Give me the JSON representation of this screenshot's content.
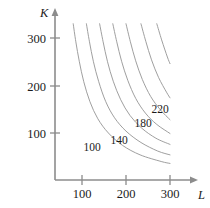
{
  "chart_data": {
    "type": "line",
    "title": "",
    "subtitle": "",
    "xlabel": "L",
    "ylabel": "K",
    "xlim": [
      0,
      330
    ],
    "ylim": [
      0,
      345
    ],
    "grid": false,
    "legend": "none",
    "xticks": [
      100,
      200,
      300
    ],
    "xticklabels": [
      "100",
      "200",
      "300"
    ],
    "yticks": [
      100,
      200,
      300
    ],
    "yticklabels": [
      "100",
      "200",
      "300"
    ],
    "axis_arrows": true,
    "series": [
      {
        "name": "100",
        "level": 100,
        "labeled": true,
        "label_x": 118,
        "label_y": 62,
        "x": [
          80,
          86,
          94,
          104,
          118,
          136,
          160,
          192,
          232,
          280,
          300
        ],
        "y": [
          330,
          292,
          250,
          208,
          166,
          130,
          100,
          74,
          54,
          40,
          36
        ]
      },
      {
        "name": "120",
        "level": 120,
        "labeled": false,
        "x": [
          110,
          117,
          126,
          138,
          154,
          174,
          200,
          234,
          272,
          300
        ],
        "y": [
          330,
          292,
          250,
          208,
          166,
          132,
          104,
          80,
          62,
          54
        ]
      },
      {
        "name": "140",
        "level": 140,
        "labeled": true,
        "label_x": 160,
        "label_y": 76,
        "x": [
          140,
          148,
          158,
          171,
          188,
          209,
          236,
          268,
          300
        ],
        "y": [
          330,
          292,
          250,
          209,
          170,
          137,
          110,
          89,
          76
        ]
      },
      {
        "name": "160",
        "level": 160,
        "labeled": false,
        "x": [
          170,
          179,
          190,
          204,
          222,
          244,
          270,
          300
        ],
        "y": [
          330,
          292,
          251,
          211,
          173,
          142,
          118,
          99
        ]
      },
      {
        "name": "180",
        "level": 180,
        "labeled": true,
        "label_x": 216,
        "label_y": 122,
        "x": [
          200,
          210,
          222,
          237,
          256,
          278,
          300
        ],
        "y": [
          330,
          292,
          252,
          213,
          177,
          149,
          128
        ]
      },
      {
        "name": "200",
        "level": 200,
        "labeled": false,
        "x": [
          234,
          245,
          258,
          274,
          292,
          300
        ],
        "y": [
          330,
          293,
          254,
          217,
          186,
          174
        ]
      },
      {
        "name": "220",
        "level": 220,
        "labeled": true,
        "label_x": 268,
        "label_y": 165,
        "x": [
          270,
          281,
          294,
          300
        ],
        "y": [
          330,
          296,
          260,
          246
        ]
      }
    ],
    "contour_labels": [
      {
        "text": "100",
        "x": 92,
        "y": 151
      },
      {
        "text": "140",
        "x": 119,
        "y": 144
      },
      {
        "text": "180",
        "x": 143,
        "y": 127
      },
      {
        "text": "220",
        "x": 160,
        "y": 113
      }
    ]
  },
  "axes": {
    "y_axis_label": "K",
    "x_axis_label": "L",
    "y_ticks": [
      {
        "label": "300",
        "y": 38
      },
      {
        "label": "200",
        "y": 86
      },
      {
        "label": "100",
        "y": 133
      }
    ],
    "x_ticks": [
      {
        "label": "100",
        "x": 82
      },
      {
        "label": "200",
        "x": 126
      },
      {
        "label": "300",
        "x": 170
      }
    ]
  },
  "colors": {
    "axis": "#8c8c8c",
    "curve": "#9a9a9a",
    "text": "#1b1b1b",
    "background": "#ffffff"
  }
}
